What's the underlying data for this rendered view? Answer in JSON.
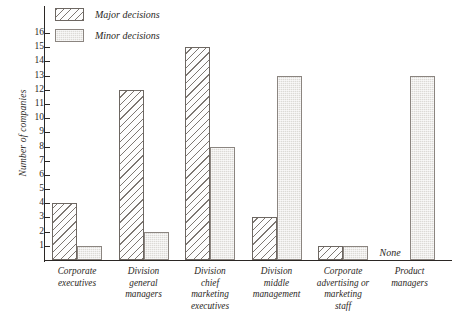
{
  "chart_data": {
    "type": "bar",
    "title": "",
    "xlabel": "",
    "ylabel": "Number of companies",
    "ylim": [
      0,
      16
    ],
    "yticks": [
      1,
      2,
      3,
      4,
      5,
      6,
      7,
      8,
      9,
      10,
      11,
      12,
      13,
      14,
      15,
      16
    ],
    "ytick_labels": [
      "1",
      "2",
      "3",
      "4",
      "5",
      "6",
      "7",
      "8",
      "9",
      "10",
      "11",
      "12",
      "13",
      "14",
      "15",
      "16"
    ],
    "grid": false,
    "legend_position": "top-left",
    "categories": [
      "Corporate executives",
      "Division general managers",
      "Division chief marketing executives",
      "Division middle management",
      "Corporate advertising or marketing staff",
      "Product managers"
    ],
    "category_label_lines": [
      [
        "Corporate",
        "executives"
      ],
      [
        "Division",
        "general",
        "managers"
      ],
      [
        "Division",
        "chief",
        "marketing",
        "executives"
      ],
      [
        "Division",
        "middle",
        "management"
      ],
      [
        "Corporate",
        "advertising or",
        "marketing",
        "staff"
      ],
      [
        "Product",
        "managers"
      ]
    ],
    "series": [
      {
        "name": "Major decisions",
        "pattern": "diagonal-hatch",
        "color": "#7d7772",
        "values": [
          4,
          12,
          15,
          3,
          1,
          0
        ],
        "value_labels": [
          "4",
          "12",
          "15",
          "3",
          "1",
          "None"
        ]
      },
      {
        "name": "Minor decisions",
        "pattern": "gray-stipple",
        "color": "#dcdad6",
        "values": [
          1,
          2,
          8,
          13,
          1,
          13
        ],
        "value_labels": [
          "1",
          "2",
          "8",
          "13",
          "1",
          "13"
        ]
      }
    ],
    "annotations": [
      {
        "text": "None",
        "category": "Product managers",
        "series": "Major decisions"
      }
    ]
  },
  "legend": {
    "items": [
      {
        "label": "Major decisions",
        "swatch": "major"
      },
      {
        "label": "Minor decisions",
        "swatch": "minor"
      }
    ]
  },
  "colors": {
    "ink": "#2b2724",
    "hatch": "#7d7772",
    "fill_minor": "#dcdad6",
    "background": "#ffffff"
  }
}
